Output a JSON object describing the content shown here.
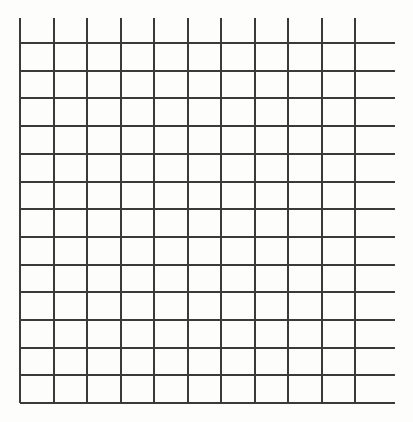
{
  "document": {
    "kind": "blank-grid-diagram",
    "title": "Blank Grid",
    "description": "Hand-drawn style empty rectangular grid of ruled lines with no labels, text or data",
    "background_color": "#fdfdfc",
    "canvas": {
      "width": 413,
      "height": 422
    }
  },
  "grid": {
    "line_color": "#3a3a3a",
    "line_width": 2,
    "columns": 10,
    "rows": 13,
    "cell_width": 33.5,
    "cell_height": 27.7,
    "vertical_line_count": 11,
    "horizontal_line_count": 14,
    "vertical_lines_x": [
      20,
      53.5,
      87,
      120.5,
      154,
      187.5,
      221,
      254.5,
      288,
      321.5,
      355
    ],
    "vertical_line_top_y": 18,
    "vertical_line_bottom_y": 403,
    "horizontal_lines_y": [
      43,
      70.7,
      98.4,
      126.1,
      153.8,
      181.5,
      209.2,
      236.9,
      264.6,
      292.3,
      320,
      347.7,
      375.4,
      403
    ],
    "horizontal_line_left_x": 20,
    "horizontal_line_right_x": 395,
    "notes": {
      "top_overshoot": "vertical lines begin above the first horizontal line",
      "right_overshoot": "horizontal lines extend past the last vertical line"
    }
  },
  "content": {
    "labels": [],
    "axis_titles": [],
    "annotations": [],
    "cell_values": []
  },
  "chart_data": {
    "type": "table",
    "title": "",
    "xlabel": "",
    "ylabel": "",
    "categories": [],
    "values": [],
    "grid": true,
    "legend": false,
    "note": "Empty grid — no plotted data, tick labels or series are present in the image"
  }
}
